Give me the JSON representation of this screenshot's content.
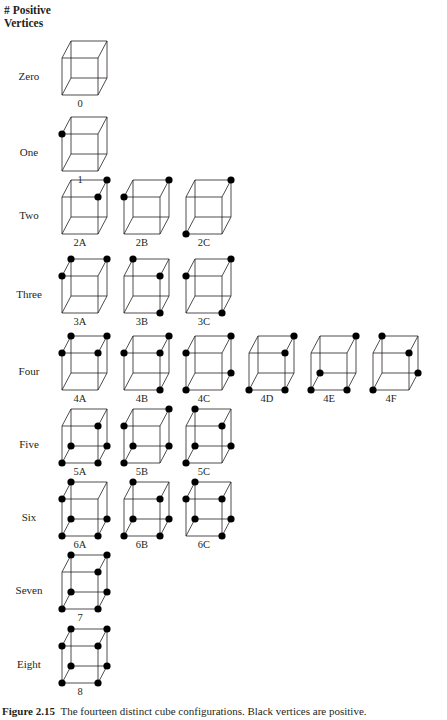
{
  "header": {
    "line1": "# Positive",
    "line2": "Vertices"
  },
  "cube_geometry": {
    "front_width": 36,
    "front_height": 37,
    "depth_dx": 9,
    "depth_dy": -17,
    "dot_radius": 3.6,
    "stroke": "#231f20",
    "dot_color": "#000000"
  },
  "columns_x": [
    62,
    124,
    186,
    249,
    311,
    373
  ],
  "rows": [
    {
      "label": "Zero",
      "front_top": 58,
      "cubes": [
        {
          "name": "0",
          "col": 0,
          "positive": []
        }
      ]
    },
    {
      "label": "One",
      "front_top": 134,
      "cubes": [
        {
          "name": "1",
          "col": 0,
          "positive": [
            "FTL"
          ]
        }
      ]
    },
    {
      "label": "Two",
      "front_top": 197,
      "cubes": [
        {
          "name": "2A",
          "col": 0,
          "positive": [
            "BTR",
            "FTR"
          ]
        },
        {
          "name": "2B",
          "col": 1,
          "positive": [
            "BTR",
            "FTL"
          ]
        },
        {
          "name": "2C",
          "col": 2,
          "positive": [
            "BTR",
            "FBL"
          ]
        }
      ]
    },
    {
      "label": "Three",
      "front_top": 276,
      "cubes": [
        {
          "name": "3A",
          "col": 0,
          "positive": [
            "BTL",
            "BTR",
            "FTL"
          ]
        },
        {
          "name": "3B",
          "col": 1,
          "positive": [
            "BTL",
            "FTR",
            "FBR"
          ]
        },
        {
          "name": "3C",
          "col": 2,
          "positive": [
            "BTR",
            "FTL",
            "FBR"
          ]
        }
      ]
    },
    {
      "label": "Four",
      "front_top": 353,
      "cubes": [
        {
          "name": "4A",
          "col": 0,
          "positive": [
            "BTL",
            "BTR",
            "FTL",
            "FTR"
          ]
        },
        {
          "name": "4B",
          "col": 1,
          "positive": [
            "BTR",
            "FTL",
            "FTR",
            "FBR"
          ]
        },
        {
          "name": "4C",
          "col": 2,
          "positive": [
            "BTR",
            "FTL",
            "BBR",
            "FBL"
          ]
        },
        {
          "name": "4D",
          "col": 3,
          "positive": [
            "BTR",
            "FTR",
            "FBL",
            "FBR"
          ]
        },
        {
          "name": "4E",
          "col": 4,
          "positive": [
            "BTR",
            "BBL",
            "FBL",
            "FBR"
          ]
        },
        {
          "name": "4F",
          "col": 5,
          "positive": [
            "BTL",
            "FTR",
            "BBR",
            "FBL"
          ]
        }
      ]
    },
    {
      "label": "Five",
      "front_top": 426,
      "cubes": [
        {
          "name": "5A",
          "col": 0,
          "positive": [
            "FTR",
            "BBL",
            "BBR",
            "FBL",
            "FBR"
          ]
        },
        {
          "name": "5B",
          "col": 1,
          "positive": [
            "BTR",
            "FTL",
            "BBL",
            "BBR",
            "FBL"
          ]
        },
        {
          "name": "5C",
          "col": 2,
          "positive": [
            "BTL",
            "FTR",
            "BBL",
            "BBR",
            "FBL"
          ]
        }
      ]
    },
    {
      "label": "Six",
      "front_top": 499,
      "cubes": [
        {
          "name": "6A",
          "col": 0,
          "positive": [
            "BTL",
            "FTL",
            "BBL",
            "BBR",
            "FBL",
            "FBR"
          ]
        },
        {
          "name": "6B",
          "col": 1,
          "positive": [
            "BTL",
            "FTR",
            "BBL",
            "BBR",
            "FBL",
            "FBR"
          ]
        },
        {
          "name": "6C",
          "col": 2,
          "positive": [
            "BTL",
            "FTL",
            "FTR",
            "BBL",
            "BBR",
            "FBR"
          ]
        }
      ]
    },
    {
      "label": "Seven",
      "front_top": 572,
      "cubes": [
        {
          "name": "7",
          "col": 0,
          "positive": [
            "BTL",
            "BTR",
            "FTR",
            "BBL",
            "BBR",
            "FBL",
            "FBR"
          ]
        }
      ]
    },
    {
      "label": "Eight",
      "front_top": 646,
      "cubes": [
        {
          "name": "8",
          "col": 0,
          "positive": [
            "BTL",
            "BTR",
            "FTL",
            "FTR",
            "BBL",
            "BBR",
            "FBL",
            "FBR"
          ]
        }
      ]
    }
  ],
  "caption": {
    "label": "Figure 2.15",
    "text": "The fourteen distinct cube configurations. Black vertices are positive."
  }
}
